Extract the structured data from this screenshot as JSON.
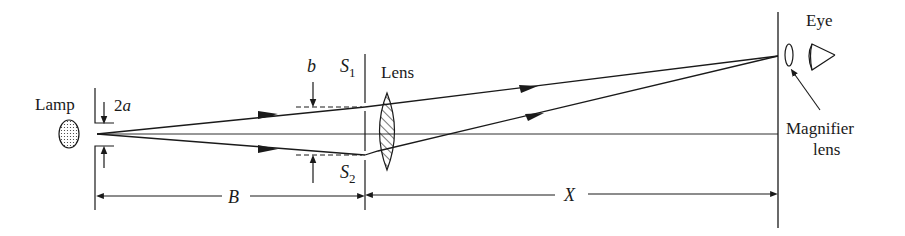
{
  "diagram": {
    "type": "optics-double-slit-setup",
    "labels": {
      "lamp": "Lamp",
      "slit_width": "2a",
      "slit_width_2": "a",
      "slit_width_num": "2",
      "slit_spacing": "b",
      "slit1": "S",
      "slit1_sub": "1",
      "slit2": "S",
      "slit2_sub": "2",
      "lens": "Lens",
      "eye": "Eye",
      "magnifier_line1": "Magnifier",
      "magnifier_line2": "lens",
      "distance_b": "B",
      "distance_x": "X"
    },
    "colors": {
      "line": "#1a1a1a",
      "background": "#ffffff"
    }
  }
}
